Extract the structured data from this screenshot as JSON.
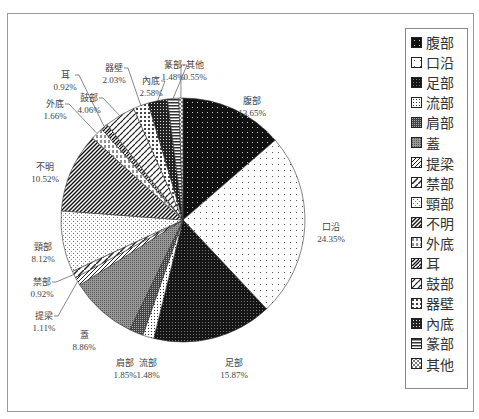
{
  "chart_data": {
    "type": "pie",
    "title": "",
    "start_angle_deg": 0,
    "direction": "clockwise",
    "categories": [
      "腹部",
      "口沿",
      "足部",
      "流部",
      "肩部",
      "蓋",
      "提梁",
      "禁部",
      "頸部",
      "不明",
      "外底",
      "耳",
      "鼓部",
      "器壁",
      "內底",
      "篆部",
      "其他"
    ],
    "values": [
      13.65,
      24.35,
      15.87,
      1.48,
      1.85,
      8.86,
      1.11,
      0.92,
      8.12,
      10.52,
      1.66,
      0.92,
      4.06,
      2.03,
      2.58,
      1.48,
      0.55
    ],
    "value_labels": [
      "13.65%",
      "24.35%",
      "15.87%",
      "1.48%",
      "1.85%",
      "8.86%",
      "1.11%",
      "0.92%",
      "8.12%",
      "10.52%",
      "1.66%",
      "0.92%",
      "4.06%",
      "2.03%",
      "2.58%",
      "1.48%",
      "0.55%"
    ],
    "legend_position": "right",
    "legend": [
      "腹部",
      "口沿",
      "足部",
      "流部",
      "肩部",
      "蓋",
      "提梁",
      "禁部",
      "頸部",
      "不明",
      "外底",
      "耳",
      "鼓部",
      "器壁",
      "內底",
      "篆部",
      "其他"
    ],
    "patterns": [
      "dense-dark-dots",
      "sparse-dots",
      "dark-checker",
      "fine-dots",
      "dark-gray-checker",
      "gray-checker",
      "diagonal-hatch",
      "wide-diagonal",
      "light-dots",
      "dense-diagonal",
      "dashed-vertical",
      "diagonal-bricks",
      "diagonal-dashes",
      "light-checker",
      "dark-grid",
      "horizontal-lines",
      "cross-diagonal"
    ]
  },
  "labels": [
    {
      "name": "腹部",
      "pct": "13.65%",
      "x": 252,
      "y": 95
    },
    {
      "name": "口沿",
      "pct": "24.35%",
      "x": 331,
      "y": 221
    },
    {
      "name": "足部",
      "pct": "15.87%",
      "x": 234,
      "y": 357
    },
    {
      "name": "流部",
      "pct": "1.48%",
      "x": 148,
      "y": 357
    },
    {
      "name": "肩部",
      "pct": "1.85%",
      "x": 125,
      "y": 357
    },
    {
      "name": "蓋",
      "pct": "8.86%",
      "x": 84,
      "y": 329
    },
    {
      "name": "提梁",
      "pct": "1.11%",
      "x": 44,
      "y": 310
    },
    {
      "name": "禁部",
      "pct": "0.92%",
      "x": 42,
      "y": 276
    },
    {
      "name": "頸部",
      "pct": "8.12%",
      "x": 43,
      "y": 241
    },
    {
      "name": "不明",
      "pct": "10.52%",
      "x": 45,
      "y": 161
    },
    {
      "name": "外底",
      "pct": "1.66%",
      "x": 55,
      "y": 98
    },
    {
      "name": "耳",
      "pct": "0.92%",
      "x": 65,
      "y": 69
    },
    {
      "name": "鼓部",
      "pct": "4.06%",
      "x": 89,
      "y": 92
    },
    {
      "name": "器壁",
      "pct": "2.03%",
      "x": 114,
      "y": 62
    },
    {
      "name": "內底",
      "pct": "2.58%",
      "x": 151,
      "y": 75
    },
    {
      "name": "篆部",
      "pct": "1.48%",
      "x": 173,
      "y": 59
    },
    {
      "name": "其他",
      "pct": "0.55%",
      "x": 195,
      "y": 59
    }
  ]
}
